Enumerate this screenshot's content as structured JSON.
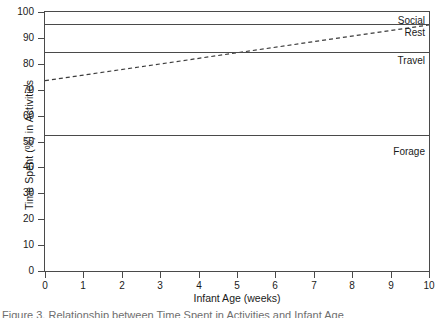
{
  "figure": {
    "caption": "Figure 3. Relationship between Time Spent in Activities and Infant Age"
  },
  "chart_data": {
    "type": "line",
    "title": "",
    "xlabel": "Infant Age (weeks)",
    "ylabel": "Time Spent (%) in Activities",
    "xlim": [
      0,
      10
    ],
    "ylim": [
      0,
      100
    ],
    "xticks": [
      "0",
      "1",
      "2",
      "3",
      "4",
      "5",
      "6",
      "7",
      "8",
      "9",
      "10"
    ],
    "yticks": [
      "0",
      "10",
      "20",
      "30",
      "40",
      "50",
      "60",
      "70",
      "80",
      "90",
      "100"
    ],
    "grid": false,
    "legend_position": "inline-right",
    "band_boundaries": [
      {
        "label": "Social",
        "top": 100,
        "bottom": 95.2
      },
      {
        "label": "Rest",
        "top": 95.2,
        "bottom": 84.4
      },
      {
        "label": "Travel",
        "top": 84.4,
        "bottom": 52.6
      },
      {
        "label": "Forage",
        "top": 52.6,
        "bottom": 0
      }
    ],
    "series": [
      {
        "name": "trend",
        "style": "dashed",
        "x": [
          0,
          10
        ],
        "values": [
          73.5,
          95.0
        ]
      }
    ],
    "annotations": [
      "Social",
      "Rest",
      "Travel",
      "Forage"
    ]
  }
}
